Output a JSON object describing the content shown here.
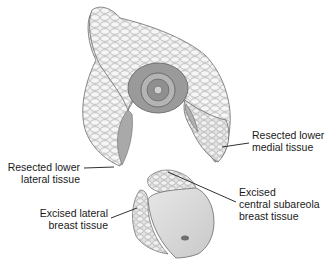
{
  "figure": {
    "colors": {
      "background": "#ffffff",
      "tissue_fill": "#ececec",
      "tissue_outline": "#6b6b6b",
      "areola": "#8a8a8a",
      "nipple": "#b5b5b5",
      "inner_cut": "#9d9d9d",
      "skin_flap": "#d9d9d9",
      "leader_line": "#1a1a1a",
      "text": "#1a1a1a"
    }
  },
  "labels": {
    "lower_medial": {
      "line1": "Resected lower",
      "line2": "medial tissue"
    },
    "lower_lateral": {
      "line1": "Resected lower",
      "line2": "lateral tissue"
    },
    "central_subareola": {
      "line1": "Excised",
      "line2": "central subareola",
      "line3": "breast tissue"
    },
    "excised_lateral": {
      "line1": "Excised lateral",
      "line2": "breast tissue"
    }
  }
}
